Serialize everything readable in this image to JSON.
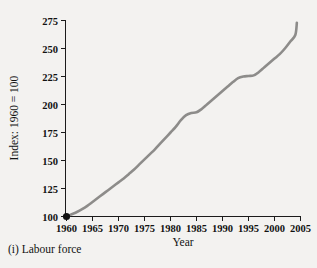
{
  "figure": {
    "caption": "(i) Labour force",
    "background_color": "#f3f2f0",
    "ink_color": "#121212"
  },
  "chart_data": {
    "type": "line",
    "title": "",
    "subtitle": "",
    "xlabel": "Year",
    "ylabel": "Index: 1960 = 100",
    "xlim": [
      1960,
      2005
    ],
    "ylim": [
      100,
      275
    ],
    "grid": false,
    "legend": null,
    "legend_position": "none",
    "series_color": "#8d8c8a",
    "marker_color": "#111111",
    "annotations": [
      {
        "label": "origin marker",
        "x": 1960,
        "y": 100
      }
    ],
    "xticks": [
      1960,
      1965,
      1970,
      1975,
      1980,
      1985,
      1990,
      1995,
      2000,
      2005
    ],
    "xtick_labels": [
      "1960",
      "1965",
      "1970",
      "1975",
      "1980",
      "1985",
      "1990",
      "1995",
      "2000",
      "2005"
    ],
    "yticks": [
      100,
      125,
      150,
      175,
      200,
      225,
      250,
      275
    ],
    "ytick_labels": [
      "100",
      "125",
      "150",
      "175",
      "200",
      "225",
      "250",
      "275"
    ],
    "series": [
      {
        "name": "Labour force",
        "x": [
          1960,
          1961,
          1962,
          1963,
          1964,
          1965,
          1966,
          1967,
          1968,
          1969,
          1970,
          1971,
          1972,
          1973,
          1974,
          1975,
          1976,
          1977,
          1978,
          1979,
          1980,
          1981,
          1982,
          1983,
          1984,
          1985,
          1986,
          1987,
          1988,
          1989,
          1990,
          1991,
          1992,
          1993,
          1994,
          1995,
          1996,
          1997,
          1998,
          1999,
          2000,
          2001,
          2002,
          2003,
          2004
        ],
        "values": [
          100,
          102,
          104,
          106.5,
          109.5,
          113,
          116.5,
          120,
          123.5,
          127,
          130.5,
          134,
          138,
          142,
          146.5,
          151,
          155.5,
          160,
          165,
          170,
          175,
          180,
          186,
          190.5,
          192.5,
          193,
          196,
          200,
          204,
          208,
          212,
          216,
          220,
          223.5,
          225,
          225.5,
          226,
          229,
          233,
          237,
          241,
          245,
          250,
          256,
          262
        ]
      }
    ],
    "series_tail": {
      "note": "curve continues to 2004 end value",
      "x_end": 2004.3,
      "y_end": 273
    }
  }
}
